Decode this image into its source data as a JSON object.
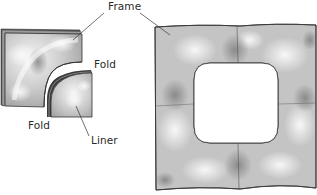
{
  "diagram": {
    "type": "illustration",
    "labels": {
      "frame": "Frame",
      "fold_upper": "Fold",
      "fold_lower": "Fold",
      "liner": "Liner"
    },
    "parts": [
      {
        "id": "frame-corner-piece",
        "description": "L-shaped quilted frame corner piece"
      },
      {
        "id": "liner-piece",
        "description": "Quarter-round liner piece"
      },
      {
        "id": "assembled-frame",
        "description": "Square quilted frame with rounded-square opening"
      }
    ],
    "colors": {
      "outline": "#3a3a3a",
      "fill_light": "#f2f2f2",
      "fill_mid": "#c8c8c8",
      "fill_dark": "#8e8e8e",
      "background": "#ffffff"
    }
  }
}
